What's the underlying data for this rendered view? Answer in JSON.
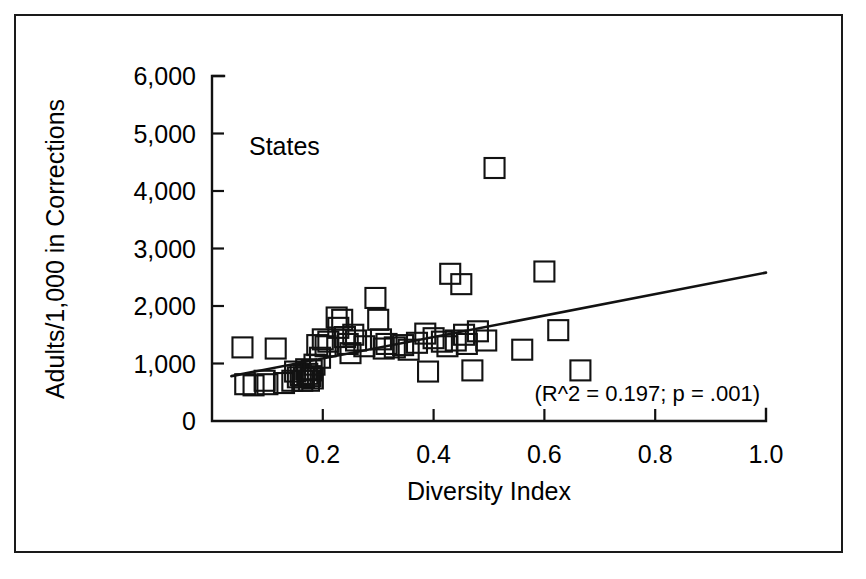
{
  "chart_data": {
    "type": "scatter",
    "title": "",
    "subtitle": "",
    "xlabel": "Diversity Index",
    "ylabel": "Adults/1,000 in Corrections",
    "xlim": [
      0.0,
      1.0
    ],
    "ylim": [
      0,
      6000
    ],
    "grid": false,
    "legend_position": "none",
    "series_label": "States",
    "annotation": "(R^2 = 0.197; p = .001)",
    "r_squared": 0.197,
    "p_value": 0.001,
    "marker_style": "open-square",
    "marker_color": "#121212",
    "xticks": [
      0.0,
      0.2,
      0.4,
      0.6,
      0.8,
      1.0
    ],
    "xtick_labels": [
      "",
      "0.2",
      "0.4",
      "0.6",
      "0.8",
      "1.0"
    ],
    "yticks": [
      0,
      1000,
      2000,
      3000,
      4000,
      5000,
      6000
    ],
    "ytick_labels": [
      "0",
      "1,000",
      "2,000",
      "3,000",
      "4,000",
      "5,000",
      "6,000"
    ],
    "trendline": {
      "type": "linear",
      "x_start": 0.035,
      "y_start": 780,
      "x_end": 1.0,
      "y_end": 2580
    },
    "points": [
      {
        "x": 0.055,
        "y": 1280
      },
      {
        "x": 0.06,
        "y": 640
      },
      {
        "x": 0.075,
        "y": 620
      },
      {
        "x": 0.095,
        "y": 700
      },
      {
        "x": 0.1,
        "y": 640
      },
      {
        "x": 0.115,
        "y": 1260
      },
      {
        "x": 0.13,
        "y": 660
      },
      {
        "x": 0.145,
        "y": 700
      },
      {
        "x": 0.15,
        "y": 860
      },
      {
        "x": 0.155,
        "y": 760
      },
      {
        "x": 0.16,
        "y": 800
      },
      {
        "x": 0.163,
        "y": 700
      },
      {
        "x": 0.166,
        "y": 760
      },
      {
        "x": 0.17,
        "y": 900
      },
      {
        "x": 0.172,
        "y": 820
      },
      {
        "x": 0.175,
        "y": 700
      },
      {
        "x": 0.178,
        "y": 780
      },
      {
        "x": 0.18,
        "y": 880
      },
      {
        "x": 0.182,
        "y": 740
      },
      {
        "x": 0.185,
        "y": 980
      },
      {
        "x": 0.19,
        "y": 1320
      },
      {
        "x": 0.195,
        "y": 1100
      },
      {
        "x": 0.2,
        "y": 1420
      },
      {
        "x": 0.205,
        "y": 1300
      },
      {
        "x": 0.21,
        "y": 1380
      },
      {
        "x": 0.225,
        "y": 1800
      },
      {
        "x": 0.228,
        "y": 1620
      },
      {
        "x": 0.235,
        "y": 1760
      },
      {
        "x": 0.24,
        "y": 1460
      },
      {
        "x": 0.245,
        "y": 1340
      },
      {
        "x": 0.25,
        "y": 1180
      },
      {
        "x": 0.255,
        "y": 1500
      },
      {
        "x": 0.26,
        "y": 1400
      },
      {
        "x": 0.275,
        "y": 1300
      },
      {
        "x": 0.295,
        "y": 2140
      },
      {
        "x": 0.3,
        "y": 1760
      },
      {
        "x": 0.305,
        "y": 1420
      },
      {
        "x": 0.31,
        "y": 1260
      },
      {
        "x": 0.315,
        "y": 1340
      },
      {
        "x": 0.33,
        "y": 1280
      },
      {
        "x": 0.345,
        "y": 1320
      },
      {
        "x": 0.355,
        "y": 1240
      },
      {
        "x": 0.37,
        "y": 1360
      },
      {
        "x": 0.385,
        "y": 1520
      },
      {
        "x": 0.39,
        "y": 860
      },
      {
        "x": 0.4,
        "y": 1440
      },
      {
        "x": 0.415,
        "y": 1380
      },
      {
        "x": 0.425,
        "y": 1300
      },
      {
        "x": 0.43,
        "y": 2560
      },
      {
        "x": 0.44,
        "y": 1400
      },
      {
        "x": 0.45,
        "y": 2380
      },
      {
        "x": 0.455,
        "y": 1500
      },
      {
        "x": 0.46,
        "y": 1340
      },
      {
        "x": 0.47,
        "y": 880
      },
      {
        "x": 0.48,
        "y": 1560
      },
      {
        "x": 0.495,
        "y": 1400
      },
      {
        "x": 0.51,
        "y": 4400
      },
      {
        "x": 0.56,
        "y": 1240
      },
      {
        "x": 0.6,
        "y": 2600
      },
      {
        "x": 0.625,
        "y": 1580
      },
      {
        "x": 0.665,
        "y": 880
      }
    ]
  },
  "axes": {
    "y_axis_name": "vertical-axis",
    "x_axis_name": "horizontal-axis"
  }
}
